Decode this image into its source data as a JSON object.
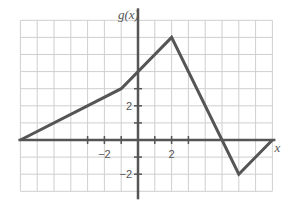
{
  "chart_data": {
    "type": "line",
    "title": "",
    "xlabel": "x",
    "ylabel": "g(x)",
    "xlim": [
      -7,
      8
    ],
    "ylim": [
      -3,
      7
    ],
    "grid": true,
    "x_tick_labels": [
      {
        "value": -2,
        "label": "−2"
      },
      {
        "value": 2,
        "label": "2"
      }
    ],
    "y_tick_labels": [
      {
        "value": 2,
        "label": "2"
      },
      {
        "value": -2,
        "label": "−2"
      }
    ],
    "x_ticks": [
      -3,
      -2,
      -1,
      1,
      2,
      3
    ],
    "y_ticks": [
      -2,
      -1,
      1,
      2,
      3
    ],
    "series": [
      {
        "name": "g(x)",
        "points": [
          [
            -7,
            0
          ],
          [
            -1,
            3
          ],
          [
            2,
            6
          ],
          [
            6,
            -2
          ],
          [
            8,
            0
          ]
        ]
      }
    ]
  },
  "colors": {
    "grid": "#cfcfcf",
    "axis": "#555555",
    "line": "#555555",
    "text": "#555555"
  },
  "layout": {
    "origin_px": [
      138,
      140
    ],
    "unit_x_px": 16.8,
    "unit_y_px": 17.1
  }
}
